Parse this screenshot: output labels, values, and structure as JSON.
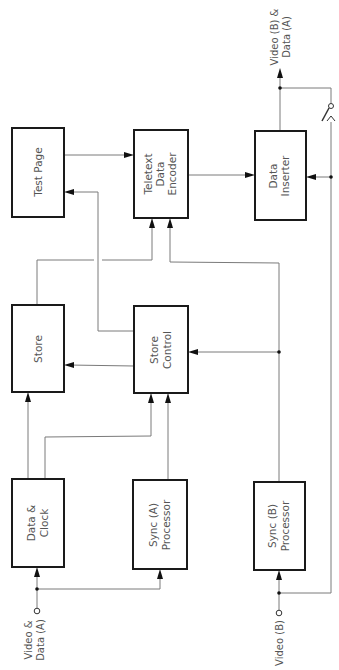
{
  "diagram": {
    "type": "block-diagram",
    "orientation": "rotated 90deg counter-clockwise (text reads bottom-to-top)",
    "blocks": {
      "test_page": {
        "lines": [
          "Test  Page"
        ]
      },
      "teletext_encoder": {
        "lines": [
          "Teletext",
          "Data",
          "Encoder"
        ]
      },
      "data_inserter": {
        "lines": [
          "Data",
          "Inserter"
        ]
      },
      "store": {
        "lines": [
          "Store"
        ]
      },
      "store_control": {
        "lines": [
          "Store",
          "Control"
        ]
      },
      "data_clock": {
        "lines": [
          "Data  &",
          "Clock"
        ]
      },
      "sync_a": {
        "lines": [
          "Sync (A)",
          "Processor"
        ]
      },
      "sync_b": {
        "lines": [
          "Sync (B)",
          "Processor"
        ]
      }
    },
    "inputs": {
      "video_data_a": {
        "lines": [
          "Video  &",
          "Data (A)"
        ]
      },
      "video_b": {
        "lines": [
          "Video (B)"
        ]
      }
    },
    "outputs": {
      "video_b_data_a": {
        "lines": [
          "Video (B) &",
          "Data (A)"
        ]
      }
    },
    "connections": [
      {
        "from": "Video & Data (A)",
        "to": "Data & Clock"
      },
      {
        "from": "Video & Data (A)",
        "to": "Sync (A) Processor"
      },
      {
        "from": "Data & Clock",
        "to": "Store"
      },
      {
        "from": "Data & Clock",
        "to": "Store Control"
      },
      {
        "from": "Sync (A) Processor",
        "to": "Store Control"
      },
      {
        "from": "Store Control",
        "to": "Store"
      },
      {
        "from": "Store Control",
        "to": "Test Page"
      },
      {
        "from": "Store",
        "to": "Teletext Data Encoder"
      },
      {
        "from": "Test Page",
        "to": "Teletext Data Encoder"
      },
      {
        "from": "Sync (B) Processor",
        "to": "Store Control"
      },
      {
        "from": "Sync (B) Processor",
        "to": "Teletext Data Encoder"
      },
      {
        "from": "Teletext Data Encoder",
        "to": "Data Inserter"
      },
      {
        "from": "Video (B)",
        "to": "Sync (B) Processor"
      },
      {
        "from": "Video (B)",
        "to": "Data Inserter"
      },
      {
        "from": "Data Inserter",
        "to": "Video (B) & Data (A)"
      },
      {
        "from": "Video (B) bypass switch",
        "to": "Video (B) & Data (A)"
      }
    ]
  }
}
